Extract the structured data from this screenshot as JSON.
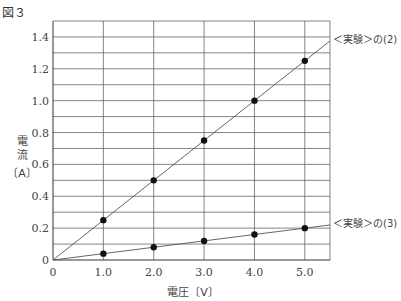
{
  "figure_label": "図３",
  "chart_data": {
    "type": "line",
    "title": "",
    "xlabel": "電圧〔V〕",
    "ylabel": [
      "電",
      "流",
      "〔A〕"
    ],
    "xlim": [
      0,
      5.5
    ],
    "ylim": [
      0,
      1.5
    ],
    "grid": true,
    "x_ticks": [
      "0",
      "1.0",
      "2.0",
      "3.0",
      "4.0",
      "5.0"
    ],
    "y_ticks": [
      "0",
      "0.2",
      "0.4",
      "0.6",
      "0.8",
      "1.0",
      "1.2",
      "1.4"
    ],
    "x": [
      1.0,
      2.0,
      3.0,
      4.0,
      5.0
    ],
    "series": [
      {
        "name": "＜実験＞の(2)",
        "values": [
          0.25,
          0.5,
          0.75,
          1.0,
          1.25
        ]
      },
      {
        "name": "＜実験＞の(3)",
        "values": [
          0.04,
          0.08,
          0.12,
          0.16,
          0.2
        ]
      }
    ],
    "legend_position": "right-end-of-lines"
  }
}
